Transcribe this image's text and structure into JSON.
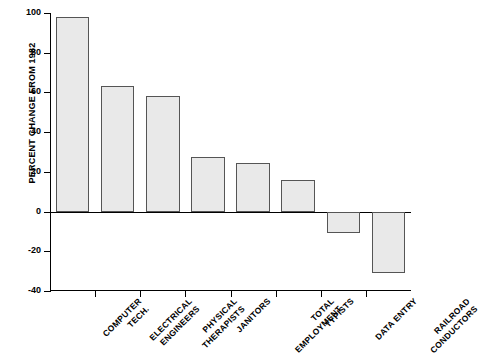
{
  "chart_data": {
    "type": "bar",
    "title": "",
    "subtitle": "",
    "xlabel": "",
    "ylabel": "PERCENT CHANGE FROM 1982",
    "ylim": [
      -40,
      100
    ],
    "yticks": [
      100,
      80,
      60,
      40,
      20,
      0,
      -20,
      -40
    ],
    "ytick_labels": [
      "100",
      "80",
      "60",
      "40",
      "20",
      "0",
      "-20",
      "-40"
    ],
    "grid": false,
    "legend": null,
    "zero_line": true,
    "bar_fill_color": "#e9e9e9",
    "bar_edge_color": "#555555",
    "categories": [
      "COMPUTER TECH.",
      "ELECTRICAL ENGINEERS",
      "PHYSICAL THERAPISTS",
      "JANITORS",
      "TOTAL EMPLOYMENT",
      "TYPISTS",
      "DATA ENTRY",
      "RAILROAD CONDUCTORS"
    ],
    "category_lines": [
      [
        "COMPUTER",
        "TECH."
      ],
      [
        "ELECTRICAL",
        "ENGINEERS"
      ],
      [
        "PHYSICAL",
        "THERAPISTS"
      ],
      [
        "JANITORS",
        ""
      ],
      [
        "TOTAL",
        "EMPLOYMENT"
      ],
      [
        "TYPISTS",
        ""
      ],
      [
        "DATA ENTRY",
        ""
      ],
      [
        "RAILROAD",
        "CONDUCTORS"
      ]
    ],
    "values": [
      98,
      63,
      58,
      27.5,
      24.5,
      16,
      -11,
      -31
    ]
  }
}
